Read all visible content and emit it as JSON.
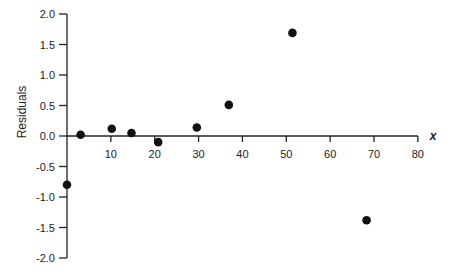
{
  "chart_data": {
    "type": "scatter",
    "title": "",
    "xlabel": "x",
    "ylabel": "Residuals",
    "xlim": [
      0,
      80
    ],
    "ylim": [
      -2.0,
      2.0
    ],
    "x_ticks": [
      10,
      20,
      30,
      40,
      50,
      60,
      70,
      80
    ],
    "x_tick_labels": [
      "10",
      "20",
      "30",
      "40",
      "50",
      "60",
      "70",
      "80"
    ],
    "y_ticks": [
      2.0,
      1.5,
      1.0,
      0.5,
      0.0,
      -0.5,
      -1.0,
      -1.5,
      -2.0
    ],
    "y_tick_labels": [
      "2.0",
      "1.5",
      "1.0",
      "0.5",
      "0.0",
      "-0.5",
      "-1.0",
      "-1.5",
      "-2.0"
    ],
    "grid": false,
    "legend": null,
    "series": [
      {
        "name": "Residuals",
        "color": "#111111",
        "points": [
          {
            "x": 0.0,
            "y": -0.8
          },
          {
            "x": 3.1,
            "y": 0.02
          },
          {
            "x": 10.2,
            "y": 0.12
          },
          {
            "x": 14.7,
            "y": 0.05
          },
          {
            "x": 20.8,
            "y": -0.1
          },
          {
            "x": 29.6,
            "y": 0.14
          },
          {
            "x": 36.9,
            "y": 0.51
          },
          {
            "x": 51.4,
            "y": 1.69
          },
          {
            "x": 68.3,
            "y": -1.38
          }
        ]
      }
    ]
  }
}
